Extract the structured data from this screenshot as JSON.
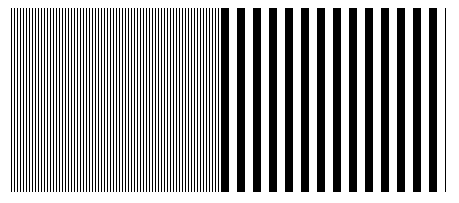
{
  "figure": {
    "colors": {
      "stripe": "#000000",
      "background": "#ffffff"
    },
    "left_grating": {
      "period_px": 3
    },
    "right_grating": {
      "period_px": 16
    }
  }
}
